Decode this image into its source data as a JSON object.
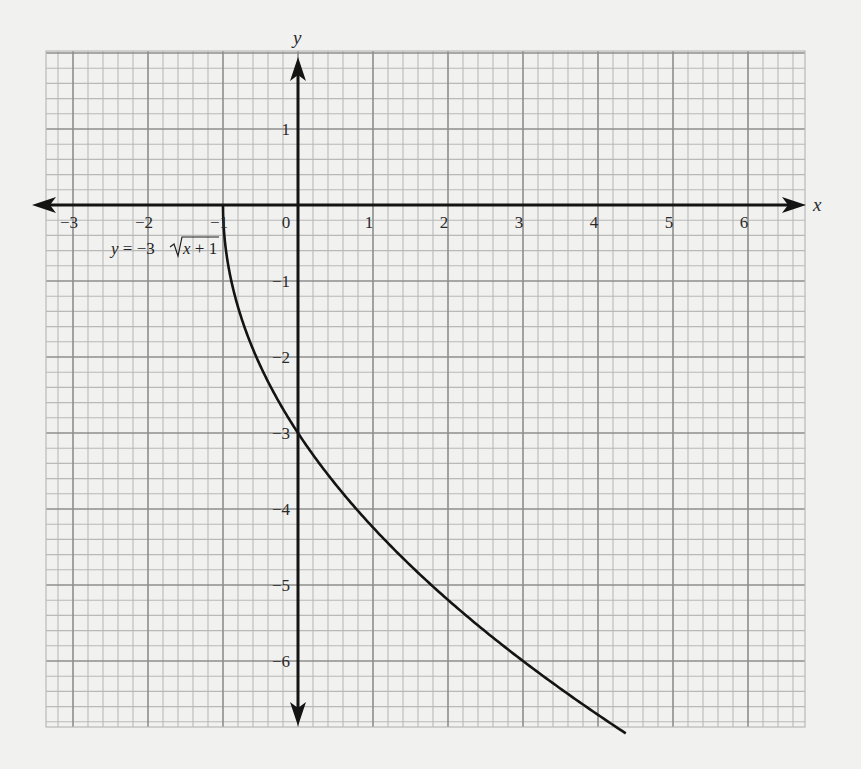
{
  "chart_data": {
    "type": "line",
    "title": "",
    "xlabel": "x",
    "ylabel": "y",
    "xlim": [
      -3.4,
      6.75
    ],
    "ylim": [
      -6.95,
      2.05
    ],
    "grid": true,
    "grid_minor_step": 0.2,
    "grid_major_step": 1,
    "x_ticks": [
      -3,
      -2,
      -1,
      0,
      1,
      2,
      3,
      4,
      5,
      6
    ],
    "x_tick_labels": [
      "−3",
      "−2",
      "−1",
      "0",
      "1",
      "2",
      "3",
      "4",
      "5",
      "6"
    ],
    "y_ticks": [
      1,
      -1,
      -2,
      -3,
      -4,
      -5,
      -6
    ],
    "y_tick_labels": [
      "1",
      "−1",
      "−2",
      "−3",
      "−4",
      "−5",
      "−6"
    ],
    "series": [
      {
        "name": "y = −3√(x + 1)",
        "function": "-3*sqrt(x+1)",
        "domain": [
          -1,
          4.37
        ],
        "x": [
          -1,
          -0.9,
          -0.75,
          -0.5,
          0,
          0.5,
          1,
          1.5,
          2,
          2.5,
          3,
          3.5,
          4,
          4.37
        ],
        "y": [
          0,
          -0.95,
          -1.5,
          -2.12,
          -3,
          -3.67,
          -4.24,
          -4.74,
          -5.2,
          -5.61,
          -6,
          -6.36,
          -6.71,
          -6.95
        ]
      }
    ],
    "annotations": [
      {
        "text": "y = −3√(x + 1)",
        "x": -1.55,
        "y": -0.6
      }
    ],
    "legend": null
  },
  "labels": {
    "x_axis": "x",
    "y_axis": "y",
    "equation_prefix": "y = −3",
    "equation_radicand": "x + 1"
  },
  "colors": {
    "background": "#f1f1f0",
    "grid_minor": "#b9b9b9",
    "grid_major": "#8e8e8e",
    "axis": "#141414",
    "curve": "#141414"
  }
}
